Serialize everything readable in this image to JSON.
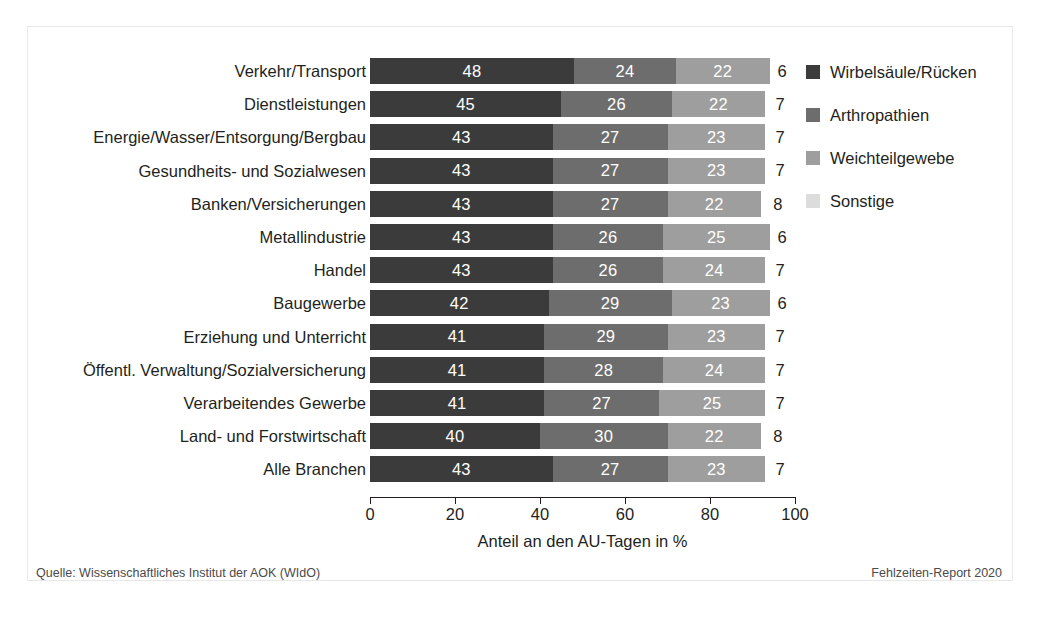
{
  "chart_data": {
    "type": "bar",
    "orientation": "horizontal",
    "stacked": true,
    "stack_mode": "percent-segments",
    "title": "",
    "xlabel": "Anteil an den AU-Tagen in %",
    "ylabel": "",
    "xlim": [
      0,
      100
    ],
    "xticks": [
      0,
      20,
      40,
      60,
      80,
      100
    ],
    "xtick_labels": [
      "0",
      "20",
      "40",
      "60",
      "80",
      "100"
    ],
    "grid": false,
    "legend_position": "right",
    "categories": [
      "Verkehr/Transport",
      "Dienstleistungen",
      "Energie/Wasser/Entsorgung/Bergbau",
      "Gesundheits- und Sozialwesen",
      "Banken/Versicherungen",
      "Metallindustrie",
      "Handel",
      "Baugewerbe",
      "Erziehung und Unterricht",
      "Öffentl. Verwaltung/Sozialversicherung",
      "Verarbeitendes Gewerbe",
      "Land- und Forstwirtschaft",
      "Alle Branchen"
    ],
    "series": [
      {
        "name": "Wirbelsäule/Rücken",
        "color": "#3b3b3b",
        "values": [
          48,
          45,
          43,
          43,
          43,
          43,
          43,
          42,
          41,
          41,
          41,
          40,
          43
        ]
      },
      {
        "name": "Arthropathien",
        "color": "#6d6d6d",
        "values": [
          24,
          26,
          27,
          27,
          27,
          26,
          26,
          29,
          29,
          28,
          27,
          30,
          27
        ]
      },
      {
        "name": "Weichteilgewebe",
        "color": "#9e9e9e",
        "values": [
          22,
          22,
          23,
          23,
          22,
          25,
          24,
          23,
          23,
          24,
          25,
          22,
          23
        ]
      },
      {
        "name": "Sonstige",
        "color": "#dcdcdc",
        "values": [
          6,
          7,
          7,
          7,
          8,
          6,
          7,
          6,
          7,
          7,
          7,
          8,
          7
        ]
      }
    ]
  },
  "legend": {
    "items": [
      {
        "label": "Wirbelsäule/Rücken",
        "color": "#3b3b3b",
        "swatch": "legend-swatch-wirbelsaeule"
      },
      {
        "label": "Arthropathien",
        "color": "#6d6d6d",
        "swatch": "legend-swatch-arthropathien"
      },
      {
        "label": "Weichteilgewebe",
        "color": "#9e9e9e",
        "swatch": "legend-swatch-weichteilgewebe"
      },
      {
        "label": "Sonstige",
        "color": "#dcdcdc",
        "swatch": "legend-swatch-sonstige"
      }
    ]
  },
  "footer": {
    "source": "Quelle: Wissenschaftliches Institut der AOK (WIdO)",
    "report": "Fehlzeiten-Report 2020"
  },
  "colors": {
    "text": "#231f20",
    "axis": "#231f20",
    "frame": "#e8e8e8",
    "background": "#ffffff",
    "segment_label_light": "#ffffff"
  }
}
